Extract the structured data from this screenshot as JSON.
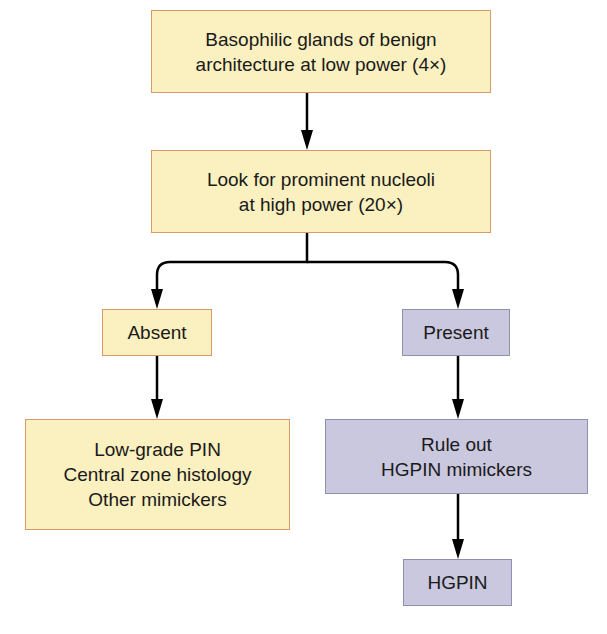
{
  "colors": {
    "yellow_fill": "#fbf0bf",
    "yellow_border": "#d89a6a",
    "purple_fill": "#c9c8de",
    "purple_border": "#8f8fb0",
    "arrow": "#000000"
  },
  "nodes": {
    "start": {
      "text": "Basophilic glands of benign\narchitecture at low power (4×)"
    },
    "check": {
      "text": "Look for prominent nucleoli\nat high power (20×)"
    },
    "absent": {
      "text": "Absent"
    },
    "present": {
      "text": "Present"
    },
    "absent_result": {
      "text": "Low-grade PIN\nCentral zone histology\nOther mimickers"
    },
    "rule_out": {
      "text": "Rule out\nHGPIN mimickers"
    },
    "hgpin": {
      "text": "HGPIN"
    }
  },
  "edges": [
    {
      "from": "start",
      "to": "check"
    },
    {
      "from": "check",
      "to": "absent"
    },
    {
      "from": "check",
      "to": "present"
    },
    {
      "from": "absent",
      "to": "absent_result"
    },
    {
      "from": "present",
      "to": "rule_out"
    },
    {
      "from": "rule_out",
      "to": "hgpin"
    }
  ]
}
